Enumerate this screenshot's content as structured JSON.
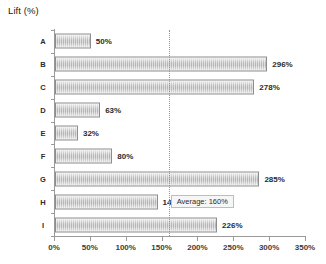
{
  "chart_data": {
    "type": "bar",
    "orientation": "horizontal",
    "title": "Lift (%)",
    "xlabel": "",
    "ylabel": "",
    "categories": [
      "A",
      "B",
      "C",
      "D",
      "E",
      "F",
      "G",
      "H",
      "I"
    ],
    "values": [
      50,
      296,
      278,
      63,
      32,
      80,
      285,
      143,
      226
    ],
    "value_labels": [
      "50%",
      "296%",
      "278%",
      "63%",
      "32%",
      "80%",
      "285%",
      "143%",
      "226%"
    ],
    "xlim": [
      0,
      350
    ],
    "xticks": [
      0,
      50,
      100,
      150,
      200,
      250,
      300,
      350
    ],
    "xtick_labels": [
      "0%",
      "50%",
      "100%",
      "150%",
      "200%",
      "250%",
      "300%",
      "350%"
    ],
    "grid": false,
    "legend": null,
    "annotations": [
      {
        "name": "average-line",
        "type": "vertical-reference-line",
        "value": 160,
        "label": "Average: 160%",
        "style": "dotted"
      }
    ],
    "colors": {
      "bar_fill_light": "#eaeaea",
      "bar_fill_dark": "#b4b4b4",
      "bar_border": "#8d8d8d",
      "axis": "#9a9a9a",
      "average_line": "#b08a8a",
      "callout_bg": "#f6f6f6",
      "callout_border": "#bdbdbd",
      "text": "#2b2b2b",
      "background": "#ffffff"
    }
  }
}
